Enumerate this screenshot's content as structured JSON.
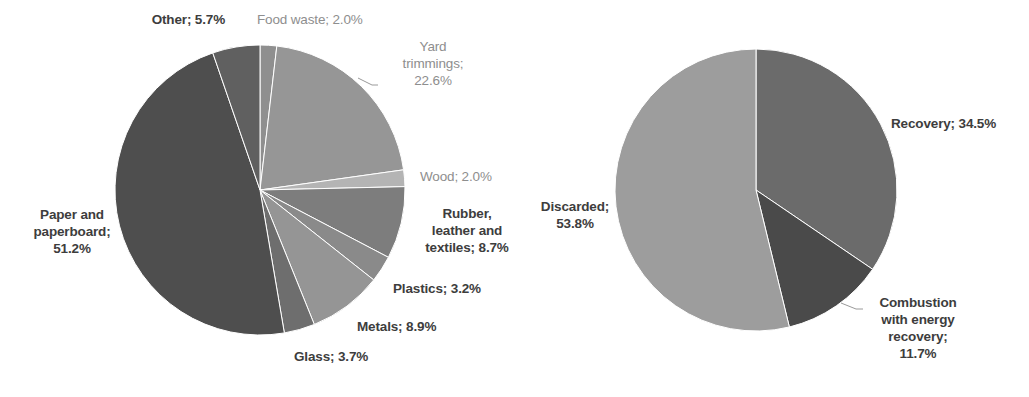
{
  "figure": {
    "background_color": "#ffffff",
    "width": 1029,
    "height": 397
  },
  "chart_data": [
    {
      "type": "pie",
      "id": "msw-materials-generated",
      "title": "",
      "legend": "none",
      "labels_position": "outside",
      "label_format": "category; percent",
      "start_angle_deg": 0,
      "direction": "clockwise",
      "categories": [
        "Food waste",
        "Yard trimmings",
        "Wood",
        "Rubber, leather and textiles",
        "Plastics",
        "Metals",
        "Glass",
        "Paper and paperboard",
        "Other"
      ],
      "values": [
        2.0,
        22.6,
        2.0,
        8.7,
        3.2,
        8.9,
        3.7,
        51.2,
        5.7
      ],
      "value_unit": "percent",
      "colors": [
        "#8f8f8f",
        "#969696",
        "#b4b4b4",
        "#7d7d7d",
        "#8a8a8a",
        "#959595",
        "#6e6e6e",
        "#4e4e4e",
        "#606060"
      ],
      "slice_labels": [
        "Food waste; 2.0%",
        "Yard\ntrimmings;\n22.6%",
        "Wood; 2.0%",
        "Rubber,\nleather and\ntextiles; 8.7%",
        "Plastics; 3.2%",
        "Metals; 8.9%",
        "Glass; 3.7%",
        "Paper and\npaperboard;\n51.2%",
        "Other; 5.7%"
      ]
    },
    {
      "type": "pie",
      "id": "msw-management",
      "title": "",
      "legend": "none",
      "labels_position": "outside",
      "label_format": "category; percent",
      "start_angle_deg": 0,
      "direction": "clockwise",
      "categories": [
        "Recovery",
        "Combustion with energy recovery",
        "Discarded"
      ],
      "values": [
        34.5,
        11.7,
        53.8
      ],
      "value_unit": "percent",
      "colors": [
        "#6b6b6b",
        "#4a4a4a",
        "#9d9d9d"
      ],
      "slice_labels": [
        "Recovery; 34.5%",
        "Combustion\nwith energy\nrecovery;\n11.7%",
        "Discarded;\n53.8%"
      ]
    }
  ],
  "left_chart": {
    "geometry": {
      "cx": 260,
      "cy": 190,
      "r": 145
    },
    "labels": [
      {
        "name": "label-other",
        "text": "Other; 5.7%",
        "weight": "bold",
        "align": "right",
        "x": 95,
        "y": 11,
        "w": 130
      },
      {
        "name": "label-food-waste",
        "text": "Food waste; 2.0%",
        "weight": "light",
        "align": "left",
        "x": 257,
        "y": 11,
        "w": 150
      },
      {
        "name": "label-yard-trimmings",
        "text": "Yard\ntrimmings;\n22.6%",
        "weight": "light",
        "align": "center",
        "x": 378,
        "y": 38,
        "w": 110
      },
      {
        "name": "label-wood",
        "text": "Wood; 2.0%",
        "weight": "light",
        "align": "left",
        "x": 420,
        "y": 168,
        "w": 120
      },
      {
        "name": "label-rubber-leather",
        "text": "Rubber,\nleather and\ntextiles; 8.7%",
        "weight": "bold",
        "align": "center",
        "x": 412,
        "y": 205,
        "w": 110
      },
      {
        "name": "label-plastics",
        "text": "Plastics; 3.2%",
        "weight": "bold",
        "align": "left",
        "x": 393,
        "y": 280,
        "w": 120
      },
      {
        "name": "label-metals",
        "text": "Metals; 8.9%",
        "weight": "bold",
        "align": "left",
        "x": 357,
        "y": 318,
        "w": 120
      },
      {
        "name": "label-glass",
        "text": "Glass; 3.7%",
        "weight": "bold",
        "align": "left",
        "x": 294,
        "y": 348,
        "w": 110
      },
      {
        "name": "label-paper-paperboard",
        "text": "Paper and\npaperboard;\n51.2%",
        "weight": "bold",
        "align": "center",
        "x": 16,
        "y": 206,
        "w": 112
      }
    ],
    "leader_lines": [
      {
        "name": "leader-yard-trimmings",
        "points": "358,78 372,85 378,85"
      }
    ]
  },
  "right_chart": {
    "geometry": {
      "cx": 236,
      "cy": 190,
      "r": 141
    },
    "labels": [
      {
        "name": "label-recovery",
        "text": "Recovery; 34.5%",
        "weight": "bold",
        "align": "left",
        "x": 371,
        "y": 115,
        "w": 150
      },
      {
        "name": "label-discarded",
        "text": "Discarded;\n53.8%",
        "weight": "bold",
        "align": "center",
        "x": 0,
        "y": 198,
        "w": 110
      },
      {
        "name": "label-combustion",
        "text": "Combustion\nwith energy\nrecovery;\n11.7%",
        "weight": "bold",
        "align": "center",
        "x": 343,
        "y": 294,
        "w": 110
      }
    ],
    "leader_lines": [
      {
        "name": "leader-combustion",
        "points": "321,303 336,309 343,309"
      }
    ]
  }
}
